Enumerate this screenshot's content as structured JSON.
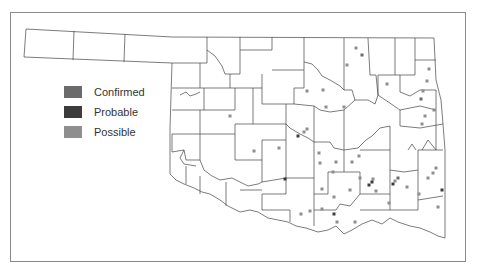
{
  "map": {
    "title": "",
    "region": "Oklahoma counties",
    "border_color": "#333333"
  },
  "legend": {
    "items": [
      {
        "label": "Confirmed",
        "color": "#6b6b6b"
      },
      {
        "label": "Probable",
        "color": "#3c3c3c"
      },
      {
        "label": "Possible",
        "color": "#8e8e8e"
      }
    ]
  },
  "markers": [
    {
      "x": 356,
      "y": 48,
      "type": "Possible"
    },
    {
      "x": 362,
      "y": 55,
      "type": "Confirmed"
    },
    {
      "x": 347,
      "y": 65,
      "type": "Possible"
    },
    {
      "x": 429,
      "y": 69,
      "type": "Possible"
    },
    {
      "x": 427,
      "y": 81,
      "type": "Possible"
    },
    {
      "x": 387,
      "y": 84,
      "type": "Possible"
    },
    {
      "x": 307,
      "y": 91,
      "type": "Possible"
    },
    {
      "x": 323,
      "y": 90,
      "type": "Possible"
    },
    {
      "x": 423,
      "y": 91,
      "type": "Possible"
    },
    {
      "x": 421,
      "y": 99,
      "type": "Confirmed"
    },
    {
      "x": 434,
      "y": 110,
      "type": "Possible"
    },
    {
      "x": 326,
      "y": 107,
      "type": "Possible"
    },
    {
      "x": 344,
      "y": 107,
      "type": "Possible"
    },
    {
      "x": 425,
      "y": 116,
      "type": "Possible"
    },
    {
      "x": 422,
      "y": 124,
      "type": "Possible"
    },
    {
      "x": 230,
      "y": 116,
      "type": "Possible"
    },
    {
      "x": 307,
      "y": 129,
      "type": "Possible"
    },
    {
      "x": 304,
      "y": 132,
      "type": "Possible"
    },
    {
      "x": 298,
      "y": 136,
      "type": "Probable"
    },
    {
      "x": 279,
      "y": 148,
      "type": "Possible"
    },
    {
      "x": 254,
      "y": 151,
      "type": "Possible"
    },
    {
      "x": 319,
      "y": 153,
      "type": "Possible"
    },
    {
      "x": 336,
      "y": 162,
      "type": "Possible"
    },
    {
      "x": 320,
      "y": 163,
      "type": "Possible"
    },
    {
      "x": 359,
      "y": 156,
      "type": "Possible"
    },
    {
      "x": 352,
      "y": 162,
      "type": "Possible"
    },
    {
      "x": 436,
      "y": 168,
      "type": "Possible"
    },
    {
      "x": 433,
      "y": 173,
      "type": "Possible"
    },
    {
      "x": 428,
      "y": 178,
      "type": "Possible"
    },
    {
      "x": 285,
      "y": 179,
      "type": "Probable"
    },
    {
      "x": 333,
      "y": 172,
      "type": "Possible"
    },
    {
      "x": 360,
      "y": 178,
      "type": "Possible"
    },
    {
      "x": 373,
      "y": 179,
      "type": "Possible"
    },
    {
      "x": 369,
      "y": 185,
      "type": "Probable"
    },
    {
      "x": 372,
      "y": 182,
      "type": "Probable"
    },
    {
      "x": 398,
      "y": 178,
      "type": "Confirmed"
    },
    {
      "x": 393,
      "y": 184,
      "type": "Probable"
    },
    {
      "x": 395,
      "y": 181,
      "type": "Possible"
    },
    {
      "x": 407,
      "y": 187,
      "type": "Possible"
    },
    {
      "x": 442,
      "y": 190,
      "type": "Probable"
    },
    {
      "x": 322,
      "y": 189,
      "type": "Possible"
    },
    {
      "x": 334,
      "y": 197,
      "type": "Possible"
    },
    {
      "x": 376,
      "y": 191,
      "type": "Possible"
    },
    {
      "x": 419,
      "y": 194,
      "type": "Possible"
    },
    {
      "x": 389,
      "y": 203,
      "type": "Possible"
    },
    {
      "x": 438,
      "y": 207,
      "type": "Possible"
    },
    {
      "x": 350,
      "y": 190,
      "type": "Possible"
    },
    {
      "x": 322,
      "y": 209,
      "type": "Possible"
    },
    {
      "x": 334,
      "y": 214,
      "type": "Probable"
    },
    {
      "x": 337,
      "y": 222,
      "type": "Possible"
    },
    {
      "x": 310,
      "y": 211,
      "type": "Possible"
    },
    {
      "x": 301,
      "y": 214,
      "type": "Possible"
    },
    {
      "x": 355,
      "y": 222,
      "type": "Possible"
    }
  ]
}
